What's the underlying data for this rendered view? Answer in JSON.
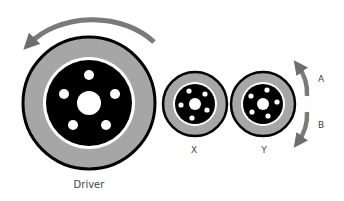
{
  "diagram": {
    "colors": {
      "tyre": "#a6a6a6",
      "rim_outline": "#000000",
      "hub": "#000000",
      "hole": "#ffffff",
      "arrow": "#7a7a7a",
      "background": "#ffffff"
    },
    "wheels": [
      {
        "id": "driver",
        "label": "Driver",
        "cx": 89,
        "cy": 103,
        "r": 67,
        "label_x": 89,
        "label_y": 184
      },
      {
        "id": "x",
        "label": "X",
        "cx": 195,
        "cy": 104,
        "r": 33,
        "label_x": 194,
        "label_y": 150
      },
      {
        "id": "y",
        "label": "Y",
        "cx": 263,
        "cy": 104,
        "r": 33,
        "label_x": 264,
        "label_y": 150
      }
    ],
    "arrows": [
      {
        "id": "driver-rotation",
        "direction": "counterclockwise",
        "label": ""
      },
      {
        "id": "arrow-a",
        "direction": "upward",
        "label": "A",
        "label_x": 321,
        "label_y": 79
      },
      {
        "id": "arrow-b",
        "direction": "downward",
        "label": "B",
        "label_x": 321,
        "label_y": 125
      }
    ]
  }
}
